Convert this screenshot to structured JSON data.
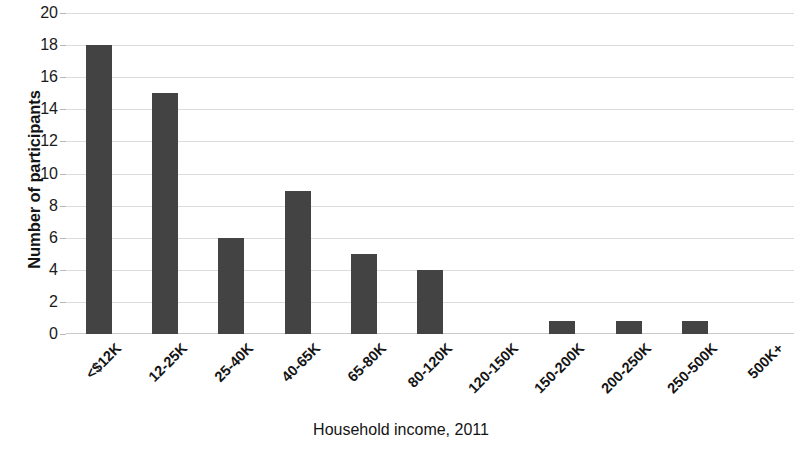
{
  "chart_data": {
    "type": "bar",
    "title": "",
    "subtitle": "",
    "xlabel": "Household income, 2011",
    "ylabel": "Number of participants",
    "categories": [
      "<$12K",
      "12-25K",
      "25-40K",
      "40-65K",
      "65-80K",
      "80-120K",
      "120-150K",
      "150-200K",
      "200-250K",
      "250-500K",
      "500K+"
    ],
    "values": [
      18,
      15,
      6,
      8.9,
      5,
      4,
      0,
      0.8,
      0.8,
      0.8,
      0
    ],
    "ylim": [
      0,
      20
    ],
    "ytick_labels": [
      "20",
      "18",
      "16",
      "14",
      "12",
      "10",
      "8",
      "6",
      "4",
      "2",
      "0"
    ],
    "ytick_values": [
      20,
      18,
      16,
      14,
      12,
      10,
      8,
      6,
      4,
      2,
      0
    ],
    "ytick_step": 2,
    "grid": true,
    "grid_axis": "y",
    "legend": false,
    "legend_position": "none",
    "bar_color": "#434343",
    "grid_color": "#dcdcdc",
    "background_color": "#ffffff",
    "xtick_label_rotation": -45
  }
}
